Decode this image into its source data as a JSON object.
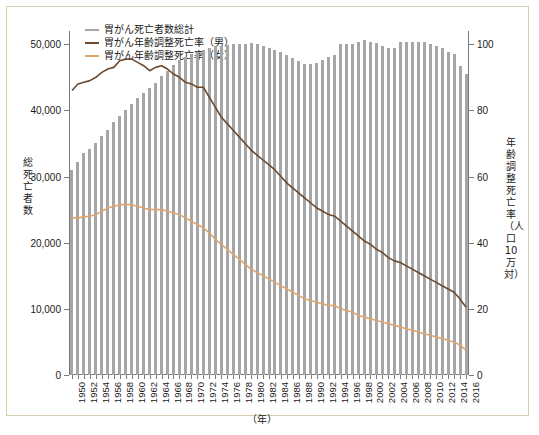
{
  "figure": {
    "xlabel_unit": "（年）",
    "ylabel_left": "総死亡者数",
    "ylabel_right": "年齢調整死亡率（人口10万対）",
    "caption": ""
  },
  "legend": {
    "position": "top-left",
    "items": [
      {
        "label": "胃がん死亡者数総計",
        "color": "#a6a6a6"
      },
      {
        "label": "胃がん年齢調整死亡率（男）",
        "color": "#6b4a2f"
      },
      {
        "label": "胃がん年齢調整死亡率（女）",
        "color": "#e0a56e"
      }
    ]
  },
  "chart_data": {
    "type": "bar",
    "title": "",
    "subtitle": "",
    "xlabel": "（年）",
    "ylabel": "総死亡者数",
    "ylabel_secondary": "年齢調整死亡率（人口10万対）",
    "ylim": [
      0,
      52000
    ],
    "ylim_secondary": [
      0,
      104
    ],
    "yticks": [
      0,
      10000,
      20000,
      30000,
      40000,
      50000
    ],
    "ytick_labels": [
      "0",
      "10,000",
      "20,000",
      "30,000",
      "40,000",
      "50,000"
    ],
    "yticks_secondary": [
      0,
      20,
      40,
      60,
      80,
      100
    ],
    "ytick_labels_secondary": [
      "0",
      "20",
      "40",
      "60",
      "80",
      "100"
    ],
    "grid": false,
    "x": [
      1950,
      1951,
      1952,
      1953,
      1954,
      1955,
      1956,
      1957,
      1958,
      1959,
      1960,
      1961,
      1962,
      1963,
      1964,
      1965,
      1966,
      1967,
      1968,
      1969,
      1970,
      1971,
      1972,
      1973,
      1974,
      1975,
      1976,
      1977,
      1978,
      1979,
      1980,
      1981,
      1982,
      1983,
      1984,
      1985,
      1986,
      1987,
      1988,
      1989,
      1990,
      1991,
      1992,
      1993,
      1994,
      1995,
      1996,
      1997,
      1998,
      1999,
      2000,
      2001,
      2002,
      2003,
      2004,
      2005,
      2006,
      2007,
      2008,
      2009,
      2010,
      2011,
      2012,
      2013,
      2014,
      2015,
      2016
    ],
    "xtick_labels": [
      "1950",
      "1952",
      "1954",
      "1956",
      "1958",
      "1960",
      "1962",
      "1964",
      "1966",
      "1968",
      "1970",
      "1972",
      "1974",
      "1976",
      "1978",
      "1980",
      "1982",
      "1984",
      "1986",
      "1988",
      "1990",
      "1992",
      "1994",
      "1996",
      "1998",
      "2000",
      "2002",
      "2004",
      "2006",
      "2008",
      "2010",
      "2012",
      "2014",
      "2016"
    ],
    "series": [
      {
        "name": "胃がん死亡者数総計",
        "type": "bar",
        "axis": "left",
        "color": "#a6a6a6",
        "values": [
          31000,
          32200,
          33600,
          34200,
          35100,
          36100,
          37000,
          38200,
          39100,
          40100,
          41000,
          41800,
          42600,
          43400,
          44200,
          45200,
          46000,
          46900,
          47600,
          48100,
          48600,
          48900,
          49200,
          49500,
          49700,
          49800,
          49900,
          50000,
          50100,
          50100,
          50200,
          50100,
          49800,
          49500,
          49200,
          48900,
          48400,
          47900,
          47400,
          47000,
          47000,
          47200,
          47600,
          48000,
          48400,
          50100,
          50000,
          50100,
          50400,
          50600,
          50400,
          50200,
          49800,
          49500,
          49400,
          50300,
          50400,
          50400,
          50300,
          50400,
          50100,
          49800,
          49400,
          48900,
          48500,
          46700,
          45500
        ]
      },
      {
        "name": "胃がん年齢調整死亡率（男）",
        "type": "line",
        "axis": "right",
        "color": "#6b4a2f",
        "values": [
          86,
          88,
          88.5,
          89,
          90,
          91.5,
          92.5,
          93,
          95,
          95.5,
          95.5,
          94.5,
          93.5,
          92,
          93,
          93.5,
          92.5,
          91,
          90,
          88.5,
          88,
          87,
          87,
          84,
          81,
          78,
          76,
          74,
          72,
          70,
          68,
          66.5,
          65,
          63.5,
          62,
          60,
          58,
          56.5,
          55,
          53.5,
          52,
          50.5,
          49.5,
          48.5,
          48,
          46.5,
          45,
          43.5,
          42,
          40.5,
          39.5,
          38,
          37,
          35.5,
          34.5,
          34,
          33,
          32,
          31,
          30,
          29,
          28,
          27,
          26,
          25,
          23,
          20.5
        ]
      },
      {
        "name": "胃がん年齢調整死亡率（女）",
        "type": "line",
        "axis": "right",
        "color": "#e0a56e",
        "values": [
          47.5,
          47.5,
          47.8,
          48,
          48.5,
          49.5,
          50.5,
          51,
          51.5,
          51.5,
          51.5,
          51,
          50.5,
          50,
          50,
          50,
          49.5,
          49,
          48.5,
          47.5,
          46.5,
          45.5,
          44.5,
          43,
          41,
          39.5,
          38,
          36.5,
          35,
          33.5,
          32,
          31,
          30,
          29,
          28,
          27,
          26,
          25,
          24,
          23,
          22.5,
          22,
          21.5,
          21,
          21,
          20,
          19.5,
          19,
          18,
          17.5,
          17,
          16.5,
          16,
          15.5,
          15,
          14.5,
          14,
          13.5,
          13,
          12.5,
          12,
          11.5,
          11,
          10.5,
          10,
          9,
          7.5
        ]
      }
    ]
  }
}
